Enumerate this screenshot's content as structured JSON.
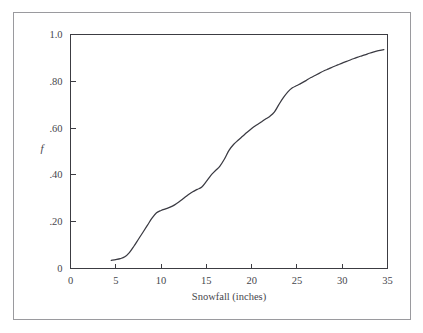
{
  "figure": {
    "border_color": "#9a9a9e",
    "background_color": "#ffffff",
    "axis_color": "#3c3c42",
    "curve_color": "#3a3a42"
  },
  "chart_data": {
    "type": "line",
    "title": "",
    "subtitle": "",
    "xlabel": "Snowfall  (inches)",
    "ylabel": "f",
    "xlim": [
      0,
      35
    ],
    "ylim": [
      0,
      1.0
    ],
    "grid": false,
    "legend": null,
    "xticks": [
      0,
      5,
      10,
      15,
      20,
      25,
      30,
      35
    ],
    "xtick_labels": [
      "0",
      "5",
      "10",
      "15",
      "20",
      "25",
      "30",
      "35"
    ],
    "yticks": [
      0,
      0.2,
      0.4,
      0.6,
      0.8,
      1.0
    ],
    "ytick_labels": [
      "0",
      ".20",
      ".40",
      ".60",
      ".80",
      "1.0"
    ],
    "series": [
      {
        "name": "Cumulative relative frequency of snowfall",
        "x": [
          4.5,
          5.0,
          5.5,
          6.0,
          6.5,
          7.0,
          7.5,
          8.0,
          8.5,
          9.0,
          9.5,
          10.0,
          10.5,
          11.0,
          11.5,
          12.0,
          12.5,
          13.0,
          13.5,
          14.0,
          14.5,
          15.0,
          15.5,
          16.0,
          16.5,
          17.0,
          17.5,
          18.0,
          18.5,
          19.0,
          19.5,
          20.0,
          20.5,
          21.0,
          21.5,
          22.0,
          22.5,
          23.0,
          23.5,
          24.0,
          24.5,
          25.0,
          25.5,
          26.0,
          26.5,
          27.0,
          27.5,
          28.0,
          28.5,
          29.0,
          29.5,
          30.0,
          30.5,
          31.0,
          31.5,
          32.0,
          32.5,
          33.0,
          33.5,
          34.0,
          34.6
        ],
        "y": [
          0.035,
          0.038,
          0.042,
          0.05,
          0.068,
          0.095,
          0.125,
          0.155,
          0.185,
          0.215,
          0.238,
          0.248,
          0.255,
          0.262,
          0.272,
          0.285,
          0.3,
          0.315,
          0.328,
          0.338,
          0.348,
          0.372,
          0.398,
          0.418,
          0.438,
          0.468,
          0.505,
          0.53,
          0.548,
          0.565,
          0.582,
          0.598,
          0.612,
          0.625,
          0.638,
          0.65,
          0.668,
          0.7,
          0.73,
          0.755,
          0.772,
          0.782,
          0.792,
          0.803,
          0.815,
          0.825,
          0.835,
          0.845,
          0.853,
          0.862,
          0.87,
          0.878,
          0.885,
          0.893,
          0.9,
          0.907,
          0.913,
          0.92,
          0.926,
          0.931,
          0.935
        ]
      }
    ]
  }
}
